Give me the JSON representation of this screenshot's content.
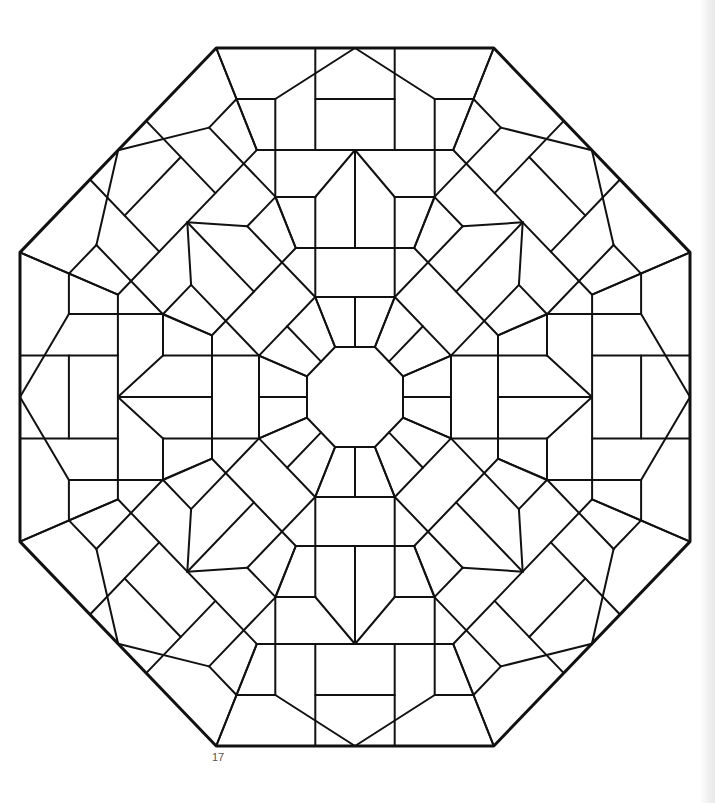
{
  "page": {
    "type": "coloring book page",
    "symmetry": "8-fold rotational",
    "line_color": "#111111",
    "background_color": "#ffffff",
    "page_number": "17"
  }
}
